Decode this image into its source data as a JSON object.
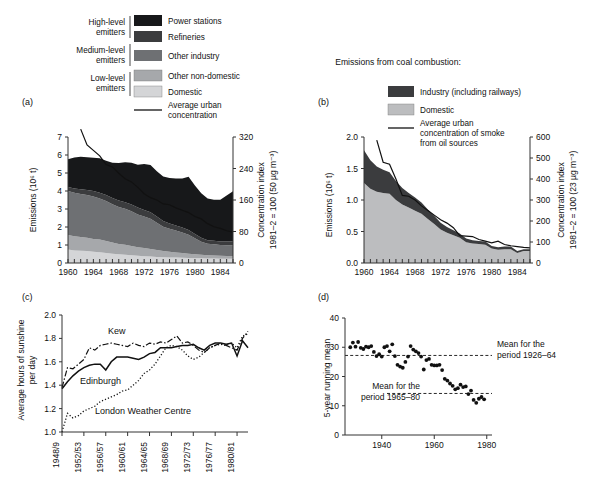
{
  "figure": {
    "panels": [
      "(a)",
      "(b)",
      "(c)",
      "(d)"
    ]
  },
  "legend_a": {
    "groups": [
      {
        "label_line1": "High-level",
        "label_line2": "emitters"
      },
      {
        "label_line1": "Medium-level",
        "label_line2": "emitters"
      },
      {
        "label_line1": "Low-level",
        "label_line2": "emitters"
      }
    ],
    "items": [
      {
        "label": "Power stations",
        "color": "#17181a"
      },
      {
        "label": "Refineries",
        "color": "#3b3c3e"
      },
      {
        "label": "Other industry",
        "color": "#6e7073"
      },
      {
        "label": "Other non-domestic",
        "color": "#a6a8ab"
      },
      {
        "label": "Domestic",
        "color": "#d4d5d7"
      }
    ],
    "line_item": {
      "label_line1": "Average urban",
      "label_line2": "concentration"
    }
  },
  "legend_b": {
    "title": "Emissions from coal combustion:",
    "items": [
      {
        "label": "Industry (including railways)",
        "color": "#3b3c3e"
      },
      {
        "label": "Domestic",
        "color": "#bcbdbf"
      }
    ],
    "line_item": {
      "label_line1": "Average urban",
      "label_line2": "concentration of smoke",
      "label_line3": "from oil sources"
    }
  },
  "chart_data": [
    {
      "panel": "(a)",
      "type": "area",
      "title": "",
      "xlabel": "",
      "ylabel": "Emissions (10⁶ t)",
      "y2label_line1": "Concentration index",
      "y2label_line2": "1981–2 = 100 (50 µg m⁻³)",
      "xlim": [
        1960,
        1986
      ],
      "ylim": [
        0,
        7
      ],
      "y2lim": [
        0,
        320
      ],
      "xticks": [
        1960,
        1964,
        1968,
        1972,
        1976,
        1980,
        1984
      ],
      "yticks": [
        0,
        1,
        2,
        3,
        4,
        5,
        6,
        7
      ],
      "y2ticks": [
        0,
        80,
        160,
        240,
        320
      ],
      "x": [
        1960,
        1961,
        1962,
        1963,
        1964,
        1965,
        1966,
        1967,
        1968,
        1969,
        1970,
        1971,
        1972,
        1973,
        1974,
        1975,
        1976,
        1977,
        1978,
        1979,
        1980,
        1981,
        1982,
        1983,
        1984,
        1985,
        1986
      ],
      "series": [
        {
          "name": "Domestic",
          "color": "#d4d5d7",
          "values": [
            0.75,
            0.7,
            0.68,
            0.66,
            0.62,
            0.6,
            0.56,
            0.52,
            0.48,
            0.46,
            0.43,
            0.4,
            0.38,
            0.36,
            0.34,
            0.32,
            0.31,
            0.3,
            0.29,
            0.28,
            0.27,
            0.26,
            0.25,
            0.25,
            0.24,
            0.24,
            0.23
          ]
        },
        {
          "name": "Other non-domestic",
          "color": "#a6a8ab",
          "values": [
            0.8,
            0.78,
            0.76,
            0.74,
            0.72,
            0.7,
            0.66,
            0.62,
            0.58,
            0.55,
            0.52,
            0.48,
            0.45,
            0.42,
            0.38,
            0.34,
            0.31,
            0.28,
            0.26,
            0.24,
            0.22,
            0.2,
            0.18,
            0.17,
            0.16,
            0.15,
            0.14
          ]
        },
        {
          "name": "Other industry",
          "color": "#6e7073",
          "values": [
            2.45,
            2.42,
            2.4,
            2.38,
            2.36,
            2.28,
            2.22,
            2.12,
            2.05,
            2.0,
            1.92,
            1.82,
            1.75,
            1.68,
            1.52,
            1.35,
            1.28,
            1.22,
            1.14,
            1.05,
            0.88,
            0.72,
            0.64,
            0.62,
            0.6,
            0.6,
            0.61
          ]
        },
        {
          "name": "Refineries",
          "color": "#3b3c3e",
          "values": [
            0.22,
            0.24,
            0.26,
            0.28,
            0.3,
            0.32,
            0.34,
            0.35,
            0.36,
            0.37,
            0.38,
            0.38,
            0.37,
            0.36,
            0.34,
            0.32,
            0.3,
            0.29,
            0.28,
            0.27,
            0.24,
            0.22,
            0.2,
            0.2,
            0.2,
            0.21,
            0.22
          ]
        },
        {
          "name": "Power stations",
          "color": "#17181a",
          "values": [
            1.55,
            1.72,
            1.8,
            1.82,
            1.85,
            1.92,
            1.9,
            1.96,
            2.08,
            2.22,
            2.32,
            2.38,
            2.55,
            2.62,
            2.52,
            2.48,
            2.52,
            2.6,
            2.72,
            2.95,
            2.7,
            2.48,
            2.32,
            2.28,
            2.32,
            2.55,
            2.78
          ]
        }
      ],
      "conc_line": {
        "name": "Average urban concentration",
        "x": [
          1962,
          1963,
          1964,
          1965,
          1966,
          1967,
          1968,
          1969,
          1970,
          1971,
          1972,
          1973,
          1974,
          1975,
          1976,
          1977,
          1978,
          1979,
          1980,
          1981,
          1982,
          1983,
          1984,
          1985,
          1986
        ],
        "values": [
          340,
          300,
          286,
          272,
          250,
          244,
          228,
          214,
          206,
          192,
          176,
          166,
          160,
          150,
          148,
          140,
          134,
          128,
          118,
          112,
          100,
          92,
          88,
          82,
          78
        ]
      }
    },
    {
      "panel": "(b)",
      "type": "area",
      "title": "",
      "xlabel": "",
      "ylabel": "Emissions (10⁶ t)",
      "y2label_line1": "Concentration index",
      "y2label_line2": "1981–2 = 100 (23 µg m⁻³)",
      "xlim": [
        1960,
        1986
      ],
      "ylim": [
        0,
        2.0
      ],
      "y2lim": [
        0,
        600
      ],
      "xticks": [
        1960,
        1964,
        1968,
        1972,
        1976,
        1980,
        1984
      ],
      "yticks": [
        0,
        0.5,
        1.0,
        1.5,
        2.0
      ],
      "y2ticks": [
        0,
        100,
        200,
        300,
        400,
        500,
        600
      ],
      "x": [
        1960,
        1961,
        1962,
        1963,
        1964,
        1965,
        1966,
        1967,
        1968,
        1969,
        1970,
        1971,
        1972,
        1973,
        1974,
        1975,
        1976,
        1977,
        1978,
        1979,
        1980,
        1981,
        1982,
        1983,
        1984,
        1985,
        1986
      ],
      "series": [
        {
          "name": "Domestic",
          "color": "#bcbdbf",
          "values": [
            1.27,
            1.18,
            1.13,
            1.11,
            1.1,
            1.0,
            0.93,
            0.88,
            0.83,
            0.78,
            0.7,
            0.62,
            0.53,
            0.48,
            0.44,
            0.4,
            0.33,
            0.31,
            0.3,
            0.29,
            0.23,
            0.21,
            0.22,
            0.22,
            0.16,
            0.19,
            0.19
          ]
        },
        {
          "name": "Industry (including railways)",
          "color": "#3b3c3e",
          "values": [
            0.52,
            0.45,
            0.4,
            0.37,
            0.34,
            0.3,
            0.26,
            0.23,
            0.21,
            0.18,
            0.15,
            0.13,
            0.11,
            0.09,
            0.08,
            0.07,
            0.06,
            0.05,
            0.05,
            0.05,
            0.04,
            0.04,
            0.04,
            0.04,
            0.03,
            0.03,
            0.03
          ]
        }
      ],
      "conc_line": {
        "name": "Average urban concentration of smoke from oil sources",
        "x": [
          1962,
          1963,
          1964,
          1965,
          1966,
          1967,
          1968,
          1969,
          1970,
          1971,
          1972,
          1973,
          1974,
          1975,
          1976,
          1977,
          1978,
          1979,
          1980,
          1981,
          1982,
          1983,
          1984,
          1985,
          1986
        ],
        "values": [
          585,
          480,
          470,
          400,
          322,
          318,
          300,
          272,
          250,
          228,
          206,
          190,
          168,
          130,
          128,
          126,
          112,
          104,
          96,
          104,
          88,
          82,
          78,
          74,
          72
        ]
      }
    },
    {
      "panel": "(c)",
      "type": "line",
      "title": "",
      "xlabel": "",
      "ylabel": "Average hours of sunshine per day",
      "ylim": [
        1.0,
        2.0
      ],
      "yticks": [
        1.0,
        1.2,
        1.4,
        1.6,
        1.8,
        2.0
      ],
      "xticks": [
        "1948/9",
        "1952/53",
        "1956/57",
        "1960/61",
        "1964/65",
        "1968/69",
        "1972/73",
        "1976/77",
        "1980/81"
      ],
      "x": [
        0,
        1,
        2,
        3,
        4,
        5,
        6,
        7,
        8,
        9,
        10,
        11,
        12,
        13,
        14,
        15,
        16,
        17,
        18,
        19,
        20,
        21,
        22,
        23,
        24,
        25,
        26,
        27,
        28,
        29,
        30,
        31,
        32,
        33,
        34
      ],
      "series": [
        {
          "name": "Kew",
          "style": "dashdot",
          "values": [
            1.38,
            1.55,
            1.54,
            1.58,
            1.62,
            1.72,
            1.7,
            1.74,
            1.75,
            1.76,
            1.75,
            1.74,
            1.73,
            1.76,
            1.74,
            1.73,
            1.76,
            1.75,
            1.77,
            1.76,
            1.79,
            1.82,
            1.76,
            1.77,
            1.74,
            1.7,
            1.68,
            1.72,
            1.74,
            1.76,
            1.74,
            1.72,
            1.7,
            1.8,
            1.86
          ]
        },
        {
          "name": "Edinburgh",
          "style": "solid",
          "values": [
            1.37,
            1.43,
            1.48,
            1.52,
            1.55,
            1.57,
            1.58,
            1.58,
            1.53,
            1.6,
            1.64,
            1.64,
            1.64,
            1.63,
            1.62,
            1.64,
            1.67,
            1.68,
            1.72,
            1.72,
            1.72,
            1.73,
            1.74,
            1.74,
            1.75,
            1.72,
            1.7,
            1.74,
            1.76,
            1.76,
            1.75,
            1.76,
            1.65,
            1.78,
            1.72
          ]
        },
        {
          "name": "London Weather Centre",
          "style": "dotted",
          "values": [
            1.0,
            1.16,
            1.12,
            1.14,
            1.18,
            1.2,
            1.22,
            1.26,
            1.28,
            1.3,
            1.32,
            1.35,
            1.36,
            1.4,
            1.44,
            1.5,
            1.53,
            1.58,
            1.65,
            1.72,
            1.74,
            1.73,
            1.7,
            1.65,
            1.62,
            1.64,
            1.68,
            1.72,
            1.74,
            1.75,
            1.74,
            1.76,
            1.72,
            1.82,
            1.84
          ]
        }
      ]
    },
    {
      "panel": "(d)",
      "type": "scatter",
      "title": "",
      "xlabel": "",
      "ylabel": "5-year running mean",
      "xlim": [
        1926,
        1982
      ],
      "ylim": [
        0,
        40
      ],
      "xticks": [
        1940,
        1960,
        1980
      ],
      "yticks": [
        0,
        10,
        20,
        30,
        40
      ],
      "points": [
        {
          "x": 1928,
          "y": 30.0
        },
        {
          "x": 1929,
          "y": 31.6
        },
        {
          "x": 1930,
          "y": 30.2
        },
        {
          "x": 1931,
          "y": 31.8
        },
        {
          "x": 1932,
          "y": 29.8
        },
        {
          "x": 1933,
          "y": 29.4
        },
        {
          "x": 1934,
          "y": 30.2
        },
        {
          "x": 1935,
          "y": 30.0
        },
        {
          "x": 1936,
          "y": 30.4
        },
        {
          "x": 1937,
          "y": 28.4
        },
        {
          "x": 1938,
          "y": 27.0
        },
        {
          "x": 1939,
          "y": 27.6
        },
        {
          "x": 1940,
          "y": 26.8
        },
        {
          "x": 1941,
          "y": 30.0
        },
        {
          "x": 1942,
          "y": 30.4
        },
        {
          "x": 1943,
          "y": 28.6
        },
        {
          "x": 1944,
          "y": 31.0
        },
        {
          "x": 1945,
          "y": 27.0
        },
        {
          "x": 1946,
          "y": 24.0
        },
        {
          "x": 1947,
          "y": 23.4
        },
        {
          "x": 1948,
          "y": 23.0
        },
        {
          "x": 1949,
          "y": 25.0
        },
        {
          "x": 1950,
          "y": 26.8
        },
        {
          "x": 1951,
          "y": 30.4
        },
        {
          "x": 1952,
          "y": 29.2
        },
        {
          "x": 1953,
          "y": 28.6
        },
        {
          "x": 1954,
          "y": 28.0
        },
        {
          "x": 1955,
          "y": 26.8
        },
        {
          "x": 1956,
          "y": 22.4
        },
        {
          "x": 1957,
          "y": 25.6
        },
        {
          "x": 1958,
          "y": 26.0
        },
        {
          "x": 1959,
          "y": 24.0
        },
        {
          "x": 1960,
          "y": 23.8
        },
        {
          "x": 1961,
          "y": 23.8
        },
        {
          "x": 1962,
          "y": 24.0
        },
        {
          "x": 1963,
          "y": 22.2
        },
        {
          "x": 1964,
          "y": 19.2
        },
        {
          "x": 1965,
          "y": 18.6
        },
        {
          "x": 1966,
          "y": 17.6
        },
        {
          "x": 1967,
          "y": 16.8
        },
        {
          "x": 1968,
          "y": 15.6
        },
        {
          "x": 1969,
          "y": 16.0
        },
        {
          "x": 1970,
          "y": 17.2
        },
        {
          "x": 1971,
          "y": 16.4
        },
        {
          "x": 1972,
          "y": 16.6
        },
        {
          "x": 1973,
          "y": 14.0
        },
        {
          "x": 1974,
          "y": 15.2
        },
        {
          "x": 1975,
          "y": 12.0
        },
        {
          "x": 1976,
          "y": 11.0
        },
        {
          "x": 1977,
          "y": 12.4
        },
        {
          "x": 1978,
          "y": 13.0
        },
        {
          "x": 1979,
          "y": 12.2
        }
      ],
      "mean_lines": [
        {
          "label_line1": "Mean for the",
          "label_line2": "period 1926–64",
          "value": 27.2,
          "x_start": 1926,
          "x_end": 1982
        },
        {
          "label_line1": "Mean for the",
          "label_line2": "period 1965–80",
          "value": 14.2,
          "x_start": 1942,
          "x_end": 1982
        }
      ]
    }
  ]
}
